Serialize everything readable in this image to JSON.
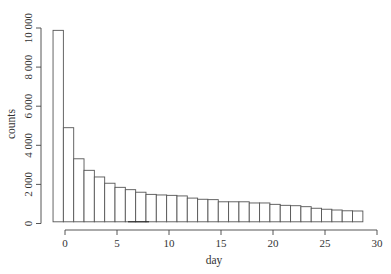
{
  "chart_data": {
    "type": "bar",
    "subtype": "histogram",
    "title": "",
    "xlabel": "day",
    "ylabel": "counts",
    "xlim": [
      -1.5,
      30
    ],
    "ylim": [
      0,
      10000
    ],
    "x_ticks": [
      0,
      5,
      10,
      15,
      20,
      25,
      30
    ],
    "x_tick_labels": [
      "0",
      "5",
      "10",
      "15",
      "20",
      "25",
      "30"
    ],
    "y_ticks": [
      0,
      2000,
      4000,
      6000,
      8000,
      10000
    ],
    "y_tick_labels": [
      "0",
      "2 000",
      "4 000",
      "6 000",
      "8 000",
      "10 000"
    ],
    "grid": false,
    "legend": null,
    "bin_start": -1.15,
    "bin_width": 0.993,
    "categories": [
      "-0.6",
      "0.3",
      "1.3",
      "2.3",
      "3.3",
      "4.3",
      "5.3",
      "6.3",
      "7.3",
      "8.3",
      "9.3",
      "10.3",
      "11.3",
      "12.3",
      "13.3",
      "14.3",
      "15.3",
      "16.3",
      "17.3",
      "18.3",
      "19.3",
      "20.3",
      "21.3",
      "22.3",
      "23.3",
      "24.3",
      "25.3",
      "26.3",
      "27.3",
      "28.2"
    ],
    "values": [
      9880,
      4900,
      3310,
      2720,
      2380,
      2060,
      1850,
      1730,
      1600,
      1490,
      1460,
      1440,
      1410,
      1300,
      1240,
      1220,
      1110,
      1110,
      1110,
      1050,
      1050,
      980,
      930,
      910,
      860,
      780,
      730,
      690,
      650,
      640
    ],
    "bar_fill": "#ffffff",
    "bar_stroke": "#555555"
  },
  "axes": {
    "x_title": "day",
    "y_title": "counts"
  }
}
